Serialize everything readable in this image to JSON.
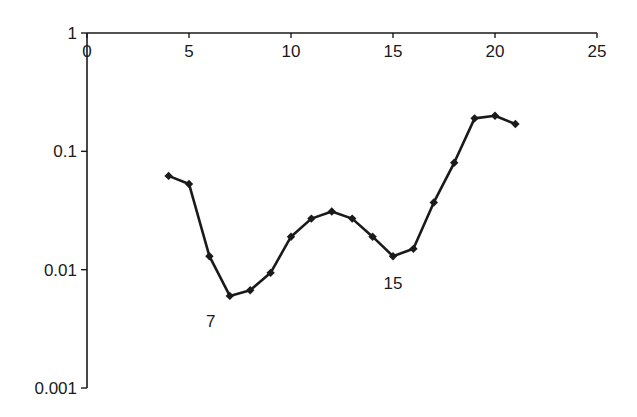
{
  "chart_data": {
    "type": "line",
    "title": "",
    "xlabel": "",
    "ylabel": "",
    "x_scale": "linear",
    "y_scale": "log",
    "xlim": [
      0,
      25
    ],
    "ylim": [
      0.001,
      1
    ],
    "x_ticks": [
      0,
      5,
      10,
      15,
      20,
      25
    ],
    "x_tick_labels": [
      "0",
      "5",
      "10",
      "15",
      "20",
      "25"
    ],
    "y_ticks": [
      1,
      0.1,
      0.01,
      0.001
    ],
    "y_tick_labels": [
      "1",
      "0.1",
      "0.01",
      "0.001"
    ],
    "x_axis_position": "top",
    "grid": false,
    "legend": null,
    "series": [
      {
        "name": "series1",
        "marker": "diamond",
        "color": "#1a1a1a",
        "x": [
          4,
          5,
          6,
          7,
          8,
          9,
          10,
          11,
          12,
          13,
          14,
          15,
          16,
          17,
          18,
          19,
          20,
          21
        ],
        "values": [
          0.062,
          0.053,
          0.013,
          0.006,
          0.0067,
          0.0094,
          0.019,
          0.027,
          0.031,
          0.027,
          0.019,
          0.013,
          0.015,
          0.037,
          0.08,
          0.19,
          0.2,
          0.17
        ]
      }
    ],
    "annotations": [
      {
        "text": "7",
        "x": 7,
        "near_value": 0.006,
        "position": "below-left"
      },
      {
        "text": "15",
        "x": 15,
        "near_value": 0.013,
        "position": "below"
      }
    ]
  }
}
